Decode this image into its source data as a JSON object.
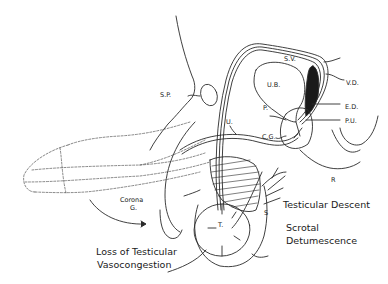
{
  "diagram": {
    "type": "anatomical-line-drawing",
    "colors": {
      "line": "#2a2a2a",
      "background": "#ffffff"
    },
    "labels": {
      "sp": "S.P.",
      "sv": "S.V.",
      "vd": "V.D.",
      "ub": "U.B.",
      "p": "P.",
      "ed": "E.D.",
      "pu": "P.U.",
      "u": "U.",
      "cg": "C.G.",
      "r": "R",
      "corona_1": "Corona",
      "corona_2": "G.",
      "t": "T.",
      "s": "S"
    },
    "annotations": {
      "testicular_descent": "Testicular Descent",
      "scrotal_1": "Scrotal",
      "scrotal_2": "Detumescence",
      "loss_1": "Loss of Testicular",
      "loss_2": "Vasocongestion"
    }
  }
}
